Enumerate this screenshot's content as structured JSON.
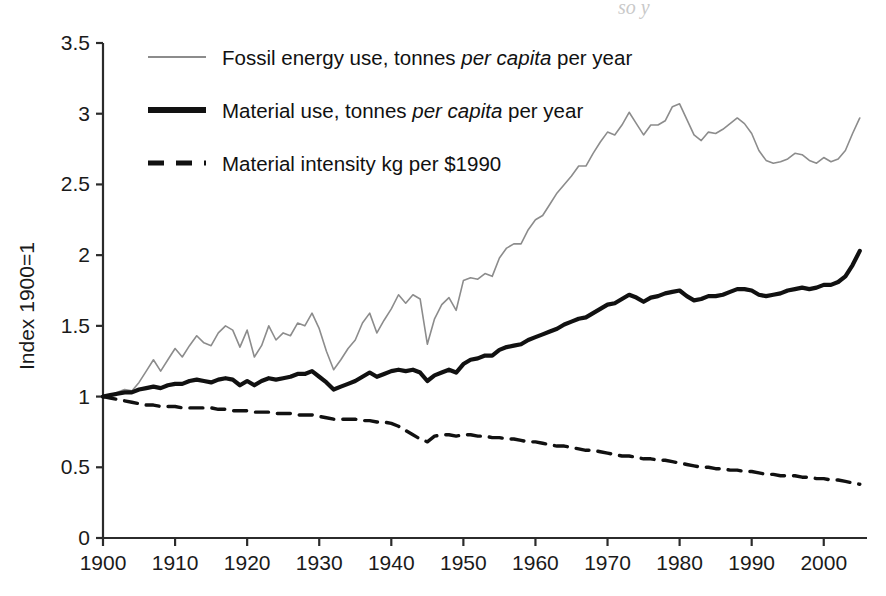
{
  "figure": {
    "ghost_caption_fragment": "so              y"
  },
  "chart_data": {
    "type": "line",
    "title": "",
    "subtitle": "",
    "xlabel": "",
    "ylabel": "Index 1900=1",
    "xlim": [
      1900,
      2006
    ],
    "ylim": [
      0,
      3.5
    ],
    "xticks": [
      1900,
      1910,
      1920,
      1930,
      1940,
      1950,
      1960,
      1970,
      1980,
      1990,
      2000
    ],
    "xticklabels": [
      "1900",
      "1910",
      "1920",
      "1930",
      "1940",
      "1950",
      "1960",
      "1970",
      "1980",
      "1990",
      "2000"
    ],
    "yticks": [
      0,
      0.5,
      1,
      1.5,
      2,
      2.5,
      3,
      3.5
    ],
    "yticklabels": [
      "0",
      "0.5",
      "1",
      "1.5",
      "2",
      "2.5",
      "3",
      "3.5"
    ],
    "grid": false,
    "legend_position": "top-left",
    "legend": [
      {
        "label_plain": "Fossil energy use, tonnes per capita per year",
        "style": "thin-gray-solid",
        "color": "#8c8c8c"
      },
      {
        "label_plain": "Material use, tonnes per capita per year",
        "style": "thick-black-solid",
        "color": "#111111"
      },
      {
        "label_plain": "Material intensity kg per $1990",
        "style": "black-dashed",
        "color": "#111111"
      }
    ],
    "series": [
      {
        "name": "Fossil energy use, tonnes per capita per year",
        "color": "#8c8c8c",
        "linestyle": "solid",
        "linewidth": 1.6,
        "x": [
          1900,
          1901,
          1902,
          1903,
          1904,
          1905,
          1906,
          1907,
          1908,
          1909,
          1910,
          1911,
          1912,
          1913,
          1914,
          1915,
          1916,
          1917,
          1918,
          1919,
          1920,
          1921,
          1922,
          1923,
          1924,
          1925,
          1926,
          1927,
          1928,
          1929,
          1930,
          1931,
          1932,
          1933,
          1934,
          1935,
          1936,
          1937,
          1938,
          1939,
          1940,
          1941,
          1942,
          1943,
          1944,
          1945,
          1946,
          1947,
          1948,
          1949,
          1950,
          1951,
          1952,
          1953,
          1954,
          1955,
          1956,
          1957,
          1958,
          1959,
          1960,
          1961,
          1962,
          1963,
          1964,
          1965,
          1966,
          1967,
          1968,
          1969,
          1970,
          1971,
          1972,
          1973,
          1974,
          1975,
          1976,
          1977,
          1978,
          1979,
          1980,
          1981,
          1982,
          1983,
          1984,
          1985,
          1986,
          1987,
          1988,
          1989,
          1990,
          1991,
          1992,
          1993,
          1994,
          1995,
          1996,
          1997,
          1998,
          1999,
          2000,
          2001,
          2002,
          2003,
          2004,
          2005
        ],
        "y": [
          1.0,
          1.01,
          1.03,
          1.05,
          1.04,
          1.1,
          1.18,
          1.26,
          1.18,
          1.26,
          1.34,
          1.28,
          1.36,
          1.43,
          1.38,
          1.36,
          1.45,
          1.5,
          1.47,
          1.35,
          1.47,
          1.28,
          1.36,
          1.5,
          1.4,
          1.45,
          1.43,
          1.52,
          1.5,
          1.59,
          1.48,
          1.32,
          1.19,
          1.26,
          1.34,
          1.4,
          1.52,
          1.59,
          1.45,
          1.54,
          1.62,
          1.72,
          1.66,
          1.72,
          1.69,
          1.37,
          1.55,
          1.65,
          1.7,
          1.61,
          1.82,
          1.84,
          1.83,
          1.87,
          1.85,
          1.98,
          2.05,
          2.08,
          2.08,
          2.18,
          2.25,
          2.28,
          2.36,
          2.44,
          2.5,
          2.56,
          2.63,
          2.63,
          2.72,
          2.8,
          2.87,
          2.85,
          2.92,
          3.01,
          2.93,
          2.85,
          2.92,
          2.92,
          2.95,
          3.05,
          3.07,
          2.96,
          2.85,
          2.81,
          2.87,
          2.86,
          2.89,
          2.93,
          2.97,
          2.93,
          2.86,
          2.74,
          2.67,
          2.65,
          2.66,
          2.68,
          2.72,
          2.71,
          2.67,
          2.65,
          2.69,
          2.66,
          2.68,
          2.74,
          2.86,
          2.97
        ]
      },
      {
        "name": "Material use, tonnes per capita per year",
        "color": "#111111",
        "linestyle": "solid",
        "linewidth": 4.2,
        "x": [
          1900,
          1901,
          1902,
          1903,
          1904,
          1905,
          1906,
          1907,
          1908,
          1909,
          1910,
          1911,
          1912,
          1913,
          1914,
          1915,
          1916,
          1917,
          1918,
          1919,
          1920,
          1921,
          1922,
          1923,
          1924,
          1925,
          1926,
          1927,
          1928,
          1929,
          1930,
          1931,
          1932,
          1933,
          1934,
          1935,
          1936,
          1937,
          1938,
          1939,
          1940,
          1941,
          1942,
          1943,
          1944,
          1945,
          1946,
          1947,
          1948,
          1949,
          1950,
          1951,
          1952,
          1953,
          1954,
          1955,
          1956,
          1957,
          1958,
          1959,
          1960,
          1961,
          1962,
          1963,
          1964,
          1965,
          1966,
          1967,
          1968,
          1969,
          1970,
          1971,
          1972,
          1973,
          1974,
          1975,
          1976,
          1977,
          1978,
          1979,
          1980,
          1981,
          1982,
          1983,
          1984,
          1985,
          1986,
          1987,
          1988,
          1989,
          1990,
          1991,
          1992,
          1993,
          1994,
          1995,
          1996,
          1997,
          1998,
          1999,
          2000,
          2001,
          2002,
          2003,
          2004,
          2005
        ],
        "y": [
          1.0,
          1.01,
          1.02,
          1.03,
          1.03,
          1.05,
          1.06,
          1.07,
          1.06,
          1.08,
          1.09,
          1.09,
          1.11,
          1.12,
          1.11,
          1.1,
          1.12,
          1.13,
          1.12,
          1.08,
          1.11,
          1.08,
          1.11,
          1.13,
          1.12,
          1.13,
          1.14,
          1.16,
          1.16,
          1.18,
          1.14,
          1.1,
          1.05,
          1.07,
          1.09,
          1.11,
          1.14,
          1.17,
          1.14,
          1.16,
          1.18,
          1.19,
          1.18,
          1.19,
          1.17,
          1.11,
          1.15,
          1.17,
          1.19,
          1.17,
          1.23,
          1.26,
          1.27,
          1.29,
          1.29,
          1.33,
          1.35,
          1.36,
          1.37,
          1.4,
          1.42,
          1.44,
          1.46,
          1.48,
          1.51,
          1.53,
          1.55,
          1.56,
          1.59,
          1.62,
          1.65,
          1.66,
          1.69,
          1.72,
          1.7,
          1.67,
          1.7,
          1.71,
          1.73,
          1.74,
          1.75,
          1.71,
          1.68,
          1.69,
          1.71,
          1.71,
          1.72,
          1.74,
          1.76,
          1.76,
          1.75,
          1.72,
          1.71,
          1.72,
          1.73,
          1.75,
          1.76,
          1.77,
          1.76,
          1.77,
          1.79,
          1.79,
          1.81,
          1.85,
          1.93,
          2.03
        ]
      },
      {
        "name": "Material intensity kg per $1990",
        "color": "#111111",
        "linestyle": "dashed",
        "linewidth": 3.4,
        "x": [
          1900,
          1901,
          1902,
          1903,
          1904,
          1905,
          1906,
          1907,
          1908,
          1909,
          1910,
          1911,
          1912,
          1913,
          1914,
          1915,
          1916,
          1917,
          1918,
          1919,
          1920,
          1921,
          1922,
          1923,
          1924,
          1925,
          1926,
          1927,
          1928,
          1929,
          1930,
          1931,
          1932,
          1933,
          1934,
          1935,
          1936,
          1937,
          1938,
          1939,
          1940,
          1941,
          1942,
          1943,
          1944,
          1945,
          1946,
          1947,
          1948,
          1949,
          1950,
          1951,
          1952,
          1953,
          1954,
          1955,
          1956,
          1957,
          1958,
          1959,
          1960,
          1961,
          1962,
          1963,
          1964,
          1965,
          1966,
          1967,
          1968,
          1969,
          1970,
          1971,
          1972,
          1973,
          1974,
          1975,
          1976,
          1977,
          1978,
          1979,
          1980,
          1981,
          1982,
          1983,
          1984,
          1985,
          1986,
          1987,
          1988,
          1989,
          1990,
          1991,
          1992,
          1993,
          1994,
          1995,
          1996,
          1997,
          1998,
          1999,
          2000,
          2001,
          2002,
          2003,
          2004,
          2005
        ],
        "y": [
          1.0,
          0.99,
          0.98,
          0.97,
          0.96,
          0.95,
          0.94,
          0.94,
          0.93,
          0.93,
          0.93,
          0.92,
          0.92,
          0.92,
          0.92,
          0.92,
          0.91,
          0.91,
          0.9,
          0.9,
          0.9,
          0.89,
          0.89,
          0.89,
          0.88,
          0.88,
          0.88,
          0.87,
          0.87,
          0.87,
          0.86,
          0.85,
          0.84,
          0.84,
          0.84,
          0.84,
          0.83,
          0.83,
          0.82,
          0.82,
          0.81,
          0.79,
          0.76,
          0.73,
          0.7,
          0.68,
          0.72,
          0.73,
          0.73,
          0.72,
          0.73,
          0.73,
          0.72,
          0.72,
          0.71,
          0.71,
          0.7,
          0.7,
          0.69,
          0.68,
          0.68,
          0.67,
          0.66,
          0.65,
          0.65,
          0.64,
          0.63,
          0.62,
          0.62,
          0.61,
          0.6,
          0.59,
          0.58,
          0.58,
          0.57,
          0.56,
          0.56,
          0.55,
          0.55,
          0.54,
          0.53,
          0.52,
          0.51,
          0.5,
          0.5,
          0.49,
          0.49,
          0.48,
          0.48,
          0.47,
          0.47,
          0.46,
          0.45,
          0.45,
          0.44,
          0.44,
          0.44,
          0.43,
          0.43,
          0.42,
          0.42,
          0.41,
          0.41,
          0.4,
          0.39,
          0.38
        ]
      }
    ]
  }
}
